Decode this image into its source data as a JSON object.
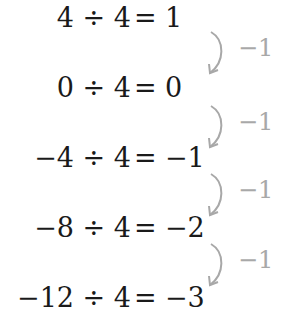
{
  "equations": [
    {
      "lhs": "4 ÷ 4",
      "eq": "=",
      "rhs": "1"
    },
    {
      "lhs": "0 ÷ 4",
      "eq": "=",
      "rhs": "0"
    },
    {
      "lhs": "−4 ÷ 4",
      "eq": "=",
      "rhs": "−1"
    },
    {
      "lhs": "−8 ÷ 4",
      "eq": "=",
      "rhs": "−2"
    },
    {
      "lhs": "−12 ÷ 4",
      "eq": "=",
      "rhs": "−3"
    }
  ],
  "steps": [
    {
      "label": "−1",
      "icon": "curved-arrow-down-icon"
    },
    {
      "label": "−1",
      "icon": "curved-arrow-down-icon"
    },
    {
      "label": "−1",
      "icon": "curved-arrow-down-icon"
    },
    {
      "label": "−1",
      "icon": "curved-arrow-down-icon"
    }
  ],
  "colors": {
    "equation": "#1a1a1a",
    "step": "#a8a8a8"
  }
}
